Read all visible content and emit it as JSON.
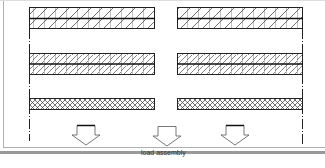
{
  "diagram": {
    "title": "",
    "label_load_assembly": "load assembly",
    "colors": {
      "line": "#222222",
      "hatch": "#333333",
      "frame": "#b0b0b0",
      "bottom_bar": "#9a9a9a",
      "background": "#ffffff"
    },
    "rows": [
      {
        "name": "row-1",
        "pattern": "single-hatch-grid",
        "y": 7,
        "height": 22
      },
      {
        "name": "row-2",
        "pattern": "dense-hatch-grid",
        "y": 53,
        "height": 22
      },
      {
        "name": "row-3",
        "pattern": "cross-hatch",
        "y": 98,
        "height": 12
      }
    ],
    "columns": [
      {
        "name": "left",
        "x": 29,
        "width": 126
      },
      {
        "name": "right",
        "x": 177,
        "width": 125
      }
    ],
    "arrows": [
      {
        "name": "arrow-1",
        "x": 72
      },
      {
        "name": "arrow-2",
        "x": 153
      },
      {
        "name": "arrow-3",
        "x": 221
      }
    ],
    "center_lines": [
      {
        "name": "left-center-line",
        "x": 29
      },
      {
        "name": "right-center-line",
        "x": 303
      }
    ]
  }
}
